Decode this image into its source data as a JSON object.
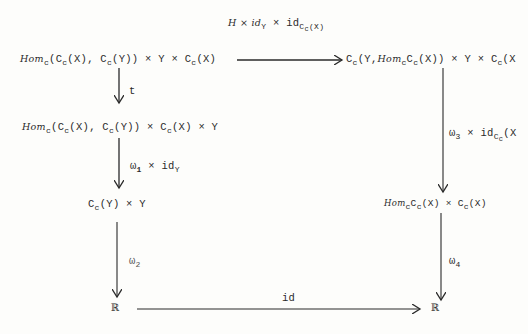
{
  "diagram": {
    "type": "commutative-diagram",
    "nodes": {
      "top_left": {
        "hom": "Hom",
        "hom_sub": "c",
        "part1": "(C",
        "part1_sub": "c",
        "part2": "(X), C",
        "part2_sub": "c",
        "part3": "(Y)) × Y × C",
        "part3_sub": "c",
        "part4": "(X)"
      },
      "top_right": {
        "part1": "C",
        "part1_sub": "c",
        "part2": "(Y,",
        "hom": "Hom",
        "hom_sub": "c",
        "part3": "C",
        "part3_sub": "c",
        "part4": "(X)) × Y × C",
        "part4_sub": "c",
        "part5": "(X"
      },
      "mid_left": {
        "hom": "Hom",
        "hom_sub": "c",
        "part1": "(C",
        "part1_sub": "c",
        "part2": "(X), C",
        "part2_sub": "c",
        "part3": "(Y)) × C",
        "part3_sub": "c",
        "part4": "(X) × Y"
      },
      "lower_left": {
        "part1": "C",
        "part1_sub": "c",
        "part2": "(Y) × Y"
      },
      "lower_right": {
        "hom": "Hom",
        "hom_sub": "c",
        "part1": "C",
        "part1_sub": "c",
        "part2": "(X) × C",
        "part2_sub": "c",
        "part3": "(X)"
      },
      "bottom_left": {
        "symbol": "ℝ"
      },
      "bottom_right": {
        "symbol": "ℝ"
      }
    },
    "arrows": {
      "top": {
        "label_main": "H × id",
        "label_sub1": "Y",
        "label_mid": " × id",
        "label_sub2": "C",
        "label_sub2_sub": "c",
        "label_end": "(X)"
      },
      "t": {
        "label": "t"
      },
      "omega1": {
        "label": "ω",
        "sub": "1",
        "rest": " × id",
        "rest_sub": "Y"
      },
      "omega2": {
        "label": "ω",
        "sub": "2"
      },
      "omega3": {
        "label": "ω",
        "sub": "3",
        "rest": " × id",
        "rest_sub": "C",
        "rest_sub_sub": "c",
        "tail": "(X"
      },
      "omega4": {
        "label": "ω",
        "sub": "4"
      },
      "bottom": {
        "label": "id"
      }
    },
    "colors": {
      "ink": "#2a2a2a",
      "paper": "#fdfdfb"
    }
  }
}
